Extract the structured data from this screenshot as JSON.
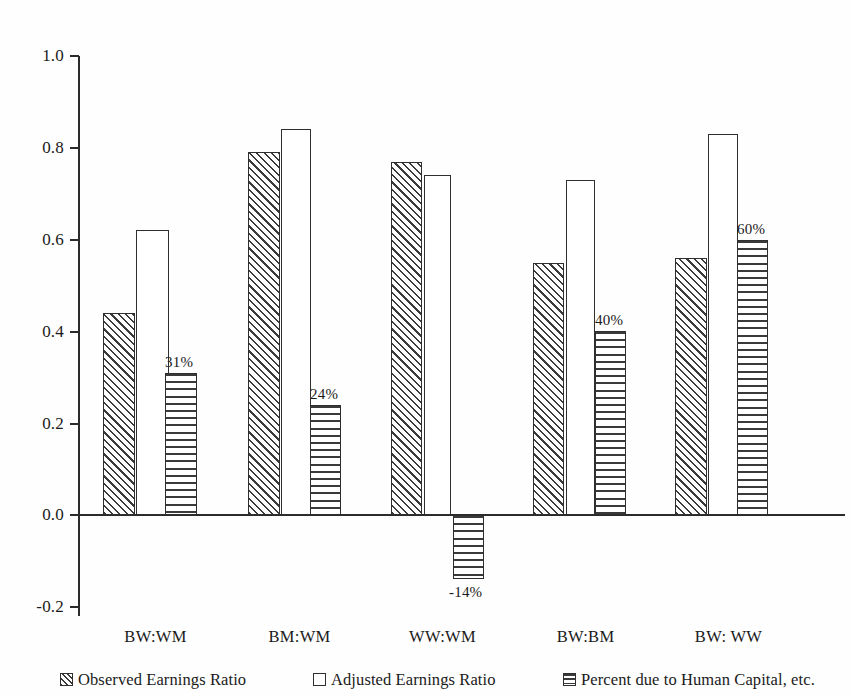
{
  "chart_data": {
    "type": "bar",
    "title": "",
    "xlabel": "",
    "ylabel": "",
    "ylim": [
      -0.2,
      1.0
    ],
    "yticks": [
      "1.0",
      "0.8",
      "0.6",
      "0.4",
      "0.2",
      "0.0",
      "-0.2"
    ],
    "ytick_values": [
      1.0,
      0.8,
      0.6,
      0.4,
      0.2,
      0.0,
      -0.2
    ],
    "grid": false,
    "legend_position": "bottom",
    "categories": [
      "BW:WM",
      "BM:WM",
      "WW:WM",
      "BW:BM",
      "BW: WW"
    ],
    "series": [
      {
        "name": "Observed Earnings Ratio",
        "pattern": "diagonal-hatch",
        "values": [
          0.44,
          0.79,
          0.77,
          0.55,
          0.56
        ]
      },
      {
        "name": "Adjusted Earnings Ratio",
        "pattern": "white",
        "values": [
          0.62,
          0.84,
          0.74,
          0.73,
          0.83
        ]
      },
      {
        "name": "Percent due to Human Capital, etc.",
        "pattern": "horizontal-lines",
        "values": [
          0.31,
          0.24,
          -0.14,
          0.4,
          0.6
        ],
        "data_labels": [
          "31%",
          "24%",
          "-14%",
          "40%",
          "60%"
        ]
      }
    ]
  },
  "axis": {
    "ticks": [
      {
        "label": "1.0",
        "value": 1.0
      },
      {
        "label": "0.8",
        "value": 0.8
      },
      {
        "label": "0.6",
        "value": 0.6
      },
      {
        "label": "0.4",
        "value": 0.4
      },
      {
        "label": "0.2",
        "value": 0.2
      },
      {
        "label": "0.0",
        "value": 0.0
      },
      {
        "label": "-0.2",
        "value": -0.2
      }
    ]
  },
  "categories": [
    {
      "label": "BW:WM"
    },
    {
      "label": "BM:WM"
    },
    {
      "label": "WW:WM"
    },
    {
      "label": "BW:BM"
    },
    {
      "label": "BW: WW"
    }
  ],
  "legend": {
    "items": [
      {
        "label": "Observed Earnings Ratio",
        "pattern": "diagonal-hatch"
      },
      {
        "label": "Adjusted Earnings Ratio",
        "pattern": "white"
      },
      {
        "label": "Percent due to Human Capital, etc.",
        "pattern": "horizontal-lines"
      }
    ]
  },
  "bar_labels": [
    {
      "text": "31%"
    },
    {
      "text": "24%"
    },
    {
      "text": "-14%"
    },
    {
      "text": "40%"
    },
    {
      "text": "60%"
    }
  ],
  "colors": {
    "ink": "#2b2b2b",
    "hatch": "#3a3a3a",
    "background": "#fefefe",
    "bar_fill": "#ffffff"
  }
}
